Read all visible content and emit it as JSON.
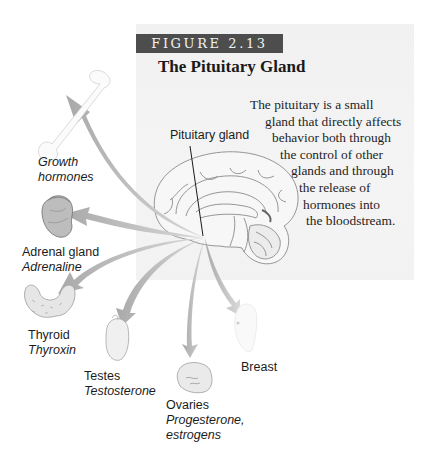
{
  "figure": {
    "number_label": "FIGURE 2.13",
    "title": "The Pituitary Gland",
    "caption_lines": [
      "The pituitary is a small",
      "gland that directly affects",
      "behavior both through",
      "the control of other",
      "glands and through",
      "the release of",
      "hormones into",
      "the bloodstream."
    ],
    "pointer_label": "Pituitary gland"
  },
  "targets": [
    {
      "organ": "",
      "hormone_lines": [
        "Growth",
        "hormones"
      ],
      "icon": "bone-icon"
    },
    {
      "organ": "Adrenal gland",
      "hormone_lines": [
        "Adrenaline"
      ],
      "icon": "adrenal-gland-icon"
    },
    {
      "organ": "Thyroid",
      "hormone_lines": [
        "Thyroxin"
      ],
      "icon": "thyroid-icon"
    },
    {
      "organ": "Testes",
      "hormone_lines": [
        "Testosterone"
      ],
      "icon": "testes-icon"
    },
    {
      "organ": "Ovaries",
      "hormone_lines": [
        "Progesterone,",
        "estrogens"
      ],
      "icon": "ovaries-icon"
    },
    {
      "organ": "Breast",
      "hormone_lines": [],
      "icon": "breast-icon"
    }
  ],
  "colors": {
    "panel_bg": "#f2f2f2",
    "figure_bar": "#4d4d4d",
    "arrow": "#b9b9b9",
    "text": "#1c1c1c"
  }
}
